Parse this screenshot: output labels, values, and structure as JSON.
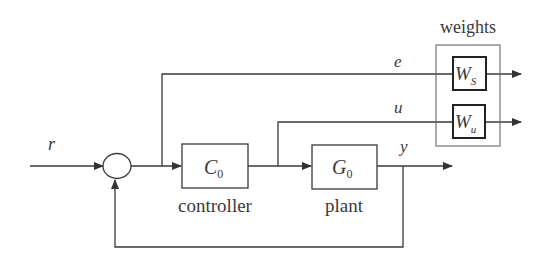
{
  "diagram": {
    "type": "feedback-control-block-diagram",
    "signals": {
      "reference": "r",
      "error": "e",
      "control": "u",
      "output": "y"
    },
    "blocks": {
      "controller": {
        "symbol": "C",
        "subscript": "0",
        "caption": "controller"
      },
      "plant": {
        "symbol": "G",
        "subscript": "0",
        "caption": "plant"
      },
      "weights_group": {
        "caption": "weights"
      },
      "weight_s": {
        "symbol": "W",
        "subscript": "S"
      },
      "weight_u": {
        "symbol": "W",
        "subscript": "u"
      }
    },
    "colors": {
      "line": "#3a3a3a",
      "background": "#ffffff"
    }
  }
}
